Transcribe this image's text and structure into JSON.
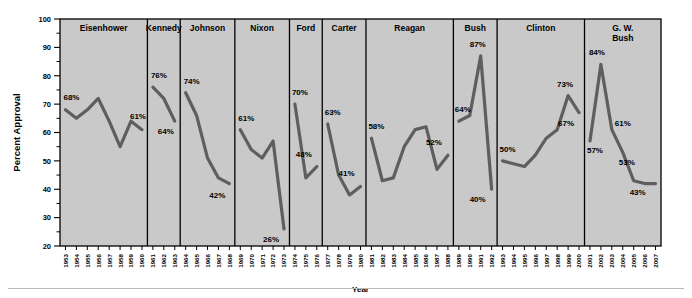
{
  "chart_data": {
    "type": "line",
    "title": "",
    "xlabel": "Year",
    "ylabel": "Percent Approval",
    "ylim": [
      20,
      100
    ],
    "ytick_step": 10,
    "yticks": [
      20,
      30,
      40,
      50,
      60,
      70,
      80,
      90,
      100
    ],
    "grid": false,
    "legend": "none",
    "panel_background": "#c9c9c9",
    "line_color": "#555555",
    "series_name": "Presidential Approval",
    "panels": [
      {
        "name": "Eisenhower",
        "years": [
          1953,
          1954,
          1955,
          1956,
          1957,
          1958,
          1959,
          1960
        ],
        "values": [
          68,
          65,
          68,
          72,
          64,
          55,
          64,
          61
        ],
        "annotations": [
          {
            "year": 1953,
            "text": "68%",
            "dx": -2,
            "dy": -10
          },
          {
            "year": 1960,
            "text": "61%",
            "dx": -12,
            "dy": -11
          }
        ]
      },
      {
        "name": "Kennedy",
        "years": [
          1961,
          1962,
          1963
        ],
        "values": [
          76,
          72,
          64
        ],
        "annotations": [
          {
            "year": 1961,
            "text": "76%",
            "dx": -2,
            "dy": -9
          },
          {
            "year": 1963,
            "text": "64%",
            "dx": -17,
            "dy": 13
          }
        ]
      },
      {
        "name": "Johnson",
        "years": [
          1964,
          1965,
          1966,
          1967,
          1968
        ],
        "values": [
          74,
          66,
          51,
          44,
          42
        ],
        "annotations": [
          {
            "year": 1964,
            "text": "74%",
            "dx": -2,
            "dy": -9
          },
          {
            "year": 1968,
            "text": "42%",
            "dx": -20,
            "dy": 14
          }
        ]
      },
      {
        "name": "Nixon",
        "years": [
          1969,
          1970,
          1971,
          1972,
          1973
        ],
        "values": [
          61,
          54,
          51,
          57,
          26
        ],
        "annotations": [
          {
            "year": 1969,
            "text": "61%",
            "dx": -2,
            "dy": -9
          },
          {
            "year": 1973,
            "text": "26%",
            "dx": -21,
            "dy": 13
          }
        ]
      },
      {
        "name": "Ford",
        "years": [
          1974,
          1975,
          1976
        ],
        "values": [
          70,
          44,
          48
        ],
        "annotations": [
          {
            "year": 1974,
            "text": "70%",
            "dx": -3,
            "dy": -9
          },
          {
            "year": 1976,
            "text": "48%",
            "dx": -21,
            "dy": -10
          }
        ]
      },
      {
        "name": "Carter",
        "years": [
          1977,
          1978,
          1979,
          1980
        ],
        "values": [
          63,
          45,
          38,
          41
        ],
        "annotations": [
          {
            "year": 1977,
            "text": "63%",
            "dx": -3,
            "dy": -9
          },
          {
            "year": 1980,
            "text": "41%",
            "dx": -22,
            "dy": -10
          }
        ]
      },
      {
        "name": "Reagan",
        "years": [
          1981,
          1982,
          1983,
          1984,
          1985,
          1986,
          1987,
          1988
        ],
        "values": [
          58,
          43,
          44,
          55,
          61,
          62,
          47,
          52
        ],
        "annotations": [
          {
            "year": 1981,
            "text": "58%",
            "dx": -3,
            "dy": -9
          },
          {
            "year": 1988,
            "text": "52%",
            "dx": -22,
            "dy": -10
          }
        ]
      },
      {
        "name": "Bush",
        "years": [
          1989,
          1990,
          1991,
          1992
        ],
        "values": [
          64,
          66,
          87,
          40
        ],
        "annotations": [
          {
            "year": 1989,
            "text": "64%",
            "dx": -4,
            "dy": -9
          },
          {
            "year": 1991,
            "text": "87%",
            "dx": -11,
            "dy": -9
          },
          {
            "year": 1992,
            "text": "40%",
            "dx": -22,
            "dy": 13
          }
        ]
      },
      {
        "name": "Clinton",
        "years": [
          1993,
          1994,
          1995,
          1996,
          1997,
          1998,
          1999,
          2000
        ],
        "values": [
          50,
          49,
          48,
          52,
          58,
          61,
          73,
          67
        ],
        "annotations": [
          {
            "year": 1993,
            "text": "50%",
            "dx": -3,
            "dy": -9
          },
          {
            "year": 1999,
            "text": "73%",
            "dx": -11,
            "dy": -9
          },
          {
            "year": 2000,
            "text": "67%",
            "dx": -21,
            "dy": 13
          }
        ]
      },
      {
        "name": "G. W. Bush",
        "years": [
          2001,
          2002,
          2003,
          2004,
          2005,
          2006,
          2007
        ],
        "values": [
          57,
          84,
          61,
          53,
          43,
          42,
          42
        ],
        "annotations": [
          {
            "year": 2001,
            "text": "57%",
            "dx": -3,
            "dy": 12
          },
          {
            "year": 2002,
            "text": "84%",
            "dx": -12,
            "dy": -9
          },
          {
            "year": 2003,
            "text": "61%",
            "dx": 3,
            "dy": -4
          },
          {
            "year": 2004,
            "text": "53%",
            "dx": -4,
            "dy": 13
          },
          {
            "year": 2005,
            "text": "43%",
            "dx": -4,
            "dy": 14
          }
        ]
      }
    ]
  }
}
